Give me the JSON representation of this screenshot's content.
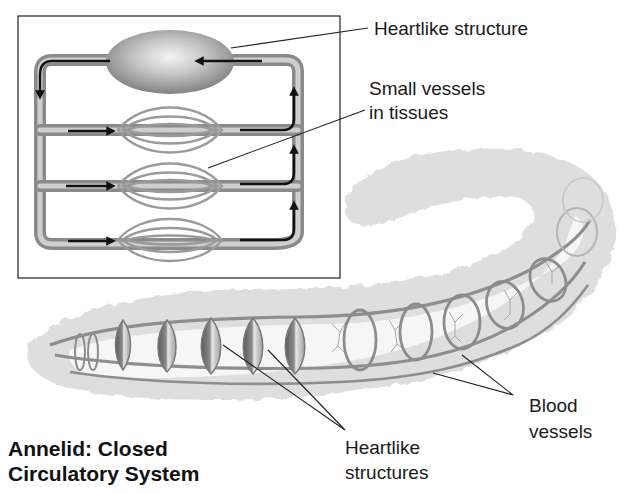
{
  "title": {
    "line1": "Annelid: Closed",
    "line2": "Circulatory System"
  },
  "labels": {
    "heartlike_structure": "Heartlike structure",
    "small_vessels_line1": "Small vessels",
    "small_vessels_line2": "in tissues",
    "blood_vessels_line1": "Blood",
    "blood_vessels_line2": "vessels",
    "heartlike_structures_line1": "Heartlike",
    "heartlike_structures_line2": "structures"
  },
  "inset": {
    "description": "Schematic of closed circulation: heartlike structure pumping blood through three capillary beds",
    "capillary_beds": 3,
    "flow_arrows": 9
  },
  "worm": {
    "heartlike_rings": 5,
    "vessel_rings": 7
  },
  "colors": {
    "vessel": "#9a9a9a",
    "vessel_dark": "#6e6e6e",
    "body": "#dcdcdc",
    "arrow": "#111111",
    "text": "#1a1a1a"
  }
}
